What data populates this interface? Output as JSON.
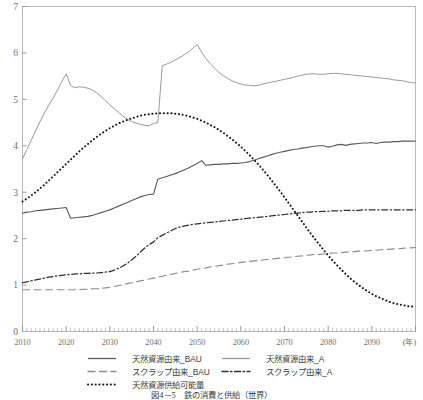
{
  "chart_data": {
    "type": "line",
    "title": "",
    "xlabel": "(年)",
    "ylabel": "",
    "xlim": [
      2010,
      2100
    ],
    "ylim": [
      0,
      7
    ],
    "grid": false,
    "legend_position": "bottom",
    "x_ticks": [
      "2010",
      "2020",
      "2030",
      "2040",
      "2050",
      "2060",
      "2070",
      "2080",
      "2090"
    ],
    "x_tick_values": [
      2010,
      2020,
      2030,
      2040,
      2050,
      2060,
      2070,
      2080,
      2090
    ],
    "x_axis_unit_label": "(年)",
    "y_ticks": [
      "0",
      "1",
      "2",
      "3",
      "4",
      "5",
      "6",
      "7"
    ],
    "y_tick_values": [
      0,
      1,
      2,
      3,
      4,
      5,
      6,
      7
    ],
    "x": [
      2010,
      2011,
      2012,
      2013,
      2014,
      2015,
      2016,
      2017,
      2018,
      2019,
      2020,
      2021,
      2022,
      2023,
      2024,
      2025,
      2026,
      2027,
      2028,
      2029,
      2030,
      2031,
      2032,
      2033,
      2034,
      2035,
      2036,
      2037,
      2038,
      2039,
      2040,
      2041,
      2042,
      2043,
      2044,
      2045,
      2046,
      2047,
      2048,
      2049,
      2050,
      2051,
      2052,
      2053,
      2054,
      2055,
      2056,
      2057,
      2058,
      2059,
      2060,
      2061,
      2062,
      2063,
      2064,
      2065,
      2066,
      2067,
      2068,
      2069,
      2070,
      2071,
      2072,
      2073,
      2074,
      2075,
      2076,
      2077,
      2078,
      2079,
      2080,
      2081,
      2082,
      2083,
      2084,
      2085,
      2086,
      2087,
      2088,
      2089,
      2090,
      2091,
      2092,
      2093,
      2094,
      2095,
      2096,
      2097,
      2098,
      2099,
      2100
    ],
    "series": [
      {
        "name": "天然資源由来_BAU",
        "style": "solid",
        "color": "#5a5a5a",
        "width": 1.15,
        "values": [
          2.55,
          2.57,
          2.58,
          2.6,
          2.61,
          2.62,
          2.63,
          2.64,
          2.65,
          2.66,
          2.67,
          2.44,
          2.45,
          2.46,
          2.47,
          2.48,
          2.5,
          2.53,
          2.56,
          2.59,
          2.62,
          2.66,
          2.7,
          2.74,
          2.78,
          2.82,
          2.86,
          2.9,
          2.93,
          2.95,
          2.96,
          3.28,
          3.31,
          3.34,
          3.37,
          3.4,
          3.44,
          3.48,
          3.52,
          3.57,
          3.62,
          3.68,
          3.58,
          3.59,
          3.6,
          3.6,
          3.61,
          3.61,
          3.62,
          3.62,
          3.63,
          3.64,
          3.66,
          3.69,
          3.72,
          3.75,
          3.78,
          3.81,
          3.84,
          3.86,
          3.88,
          3.9,
          3.92,
          3.93,
          3.95,
          3.96,
          3.98,
          3.99,
          4.0,
          4.0,
          3.97,
          3.99,
          4.02,
          4.03,
          4.01,
          4.03,
          4.04,
          4.05,
          4.06,
          4.06,
          4.07,
          4.05,
          4.07,
          4.08,
          4.08,
          4.09,
          4.09,
          4.1,
          4.1,
          4.1,
          4.1
        ]
      },
      {
        "name": "天然資源由来_A",
        "style": "solid",
        "color": "#999999",
        "width": 1.0,
        "values": [
          3.72,
          3.92,
          4.12,
          4.32,
          4.52,
          4.7,
          4.87,
          5.03,
          5.2,
          5.38,
          5.55,
          5.3,
          5.25,
          5.27,
          5.26,
          5.24,
          5.2,
          5.14,
          5.06,
          4.97,
          4.88,
          4.8,
          4.72,
          4.64,
          4.57,
          4.52,
          4.49,
          4.46,
          4.44,
          4.43,
          4.48,
          4.5,
          5.72,
          5.76,
          5.8,
          5.85,
          5.9,
          5.96,
          6.02,
          6.1,
          6.18,
          6.02,
          5.88,
          5.77,
          5.67,
          5.58,
          5.51,
          5.45,
          5.4,
          5.36,
          5.33,
          5.31,
          5.3,
          5.29,
          5.3,
          5.33,
          5.35,
          5.37,
          5.39,
          5.41,
          5.43,
          5.45,
          5.47,
          5.5,
          5.52,
          5.54,
          5.55,
          5.55,
          5.54,
          5.54,
          5.55,
          5.56,
          5.56,
          5.55,
          5.54,
          5.53,
          5.52,
          5.51,
          5.5,
          5.49,
          5.48,
          5.47,
          5.46,
          5.45,
          5.44,
          5.42,
          5.41,
          5.4,
          5.38,
          5.36,
          5.35
        ]
      },
      {
        "name": "スクラップ由来_BAU",
        "style": "dashed",
        "color": "#8c8c8c",
        "width": 1.15,
        "values": [
          0.9,
          0.9,
          0.9,
          0.9,
          0.9,
          0.9,
          0.9,
          0.9,
          0.9,
          0.9,
          0.9,
          0.9,
          0.9,
          0.9,
          0.91,
          0.91,
          0.92,
          0.92,
          0.93,
          0.94,
          0.95,
          0.97,
          0.99,
          1.01,
          1.03,
          1.05,
          1.07,
          1.09,
          1.11,
          1.13,
          1.15,
          1.17,
          1.19,
          1.21,
          1.23,
          1.25,
          1.27,
          1.29,
          1.3,
          1.32,
          1.34,
          1.36,
          1.37,
          1.39,
          1.4,
          1.42,
          1.43,
          1.45,
          1.46,
          1.47,
          1.49,
          1.5,
          1.51,
          1.52,
          1.53,
          1.54,
          1.55,
          1.56,
          1.57,
          1.58,
          1.59,
          1.6,
          1.61,
          1.62,
          1.63,
          1.64,
          1.65,
          1.66,
          1.66,
          1.67,
          1.68,
          1.69,
          1.69,
          1.7,
          1.71,
          1.71,
          1.72,
          1.73,
          1.73,
          1.74,
          1.75,
          1.75,
          1.76,
          1.77,
          1.77,
          1.78,
          1.78,
          1.79,
          1.8,
          1.8,
          1.81
        ]
      },
      {
        "name": "スクラップ由来_A",
        "style": "dashdot",
        "color": "#2f2f2f",
        "width": 1.25,
        "values": [
          1.05,
          1.07,
          1.09,
          1.11,
          1.13,
          1.15,
          1.17,
          1.18,
          1.2,
          1.21,
          1.22,
          1.23,
          1.24,
          1.24,
          1.25,
          1.25,
          1.26,
          1.26,
          1.27,
          1.28,
          1.29,
          1.32,
          1.36,
          1.41,
          1.47,
          1.54,
          1.62,
          1.71,
          1.8,
          1.87,
          1.93,
          2.02,
          2.07,
          2.12,
          2.17,
          2.22,
          2.25,
          2.27,
          2.29,
          2.31,
          2.32,
          2.33,
          2.34,
          2.35,
          2.36,
          2.37,
          2.38,
          2.39,
          2.4,
          2.41,
          2.42,
          2.43,
          2.44,
          2.45,
          2.46,
          2.47,
          2.48,
          2.49,
          2.5,
          2.51,
          2.52,
          2.53,
          2.54,
          2.55,
          2.56,
          2.57,
          2.57,
          2.58,
          2.58,
          2.59,
          2.59,
          2.6,
          2.6,
          2.6,
          2.61,
          2.61,
          2.61,
          2.61,
          2.62,
          2.62,
          2.62,
          2.62,
          2.62,
          2.62,
          2.62,
          2.62,
          2.62,
          2.62,
          2.62,
          2.62,
          2.62
        ]
      },
      {
        "name": "天然資源供給可能量",
        "style": "dotted",
        "color": "#111111",
        "width": 2.0,
        "values": [
          2.8,
          2.86,
          2.93,
          3.0,
          3.08,
          3.16,
          3.25,
          3.34,
          3.43,
          3.52,
          3.61,
          3.7,
          3.79,
          3.88,
          3.96,
          4.04,
          4.12,
          4.19,
          4.26,
          4.32,
          4.38,
          4.43,
          4.48,
          4.52,
          4.56,
          4.59,
          4.62,
          4.65,
          4.67,
          4.68,
          4.69,
          4.7,
          4.7,
          4.7,
          4.7,
          4.69,
          4.68,
          4.66,
          4.64,
          4.61,
          4.58,
          4.54,
          4.5,
          4.45,
          4.4,
          4.34,
          4.28,
          4.21,
          4.14,
          4.06,
          3.98,
          3.89,
          3.8,
          3.7,
          3.6,
          3.49,
          3.38,
          3.26,
          3.14,
          3.02,
          2.89,
          2.76,
          2.63,
          2.5,
          2.37,
          2.24,
          2.11,
          1.99,
          1.87,
          1.75,
          1.64,
          1.53,
          1.43,
          1.33,
          1.24,
          1.15,
          1.07,
          1.0,
          0.93,
          0.87,
          0.81,
          0.76,
          0.72,
          0.68,
          0.64,
          0.61,
          0.59,
          0.57,
          0.55,
          0.54,
          0.53
        ]
      }
    ]
  },
  "legend": {
    "items": [
      {
        "label": "天然資源由来_BAU",
        "style": "solid",
        "color": "#5a5a5a"
      },
      {
        "label": "天然資源由来_A",
        "style": "solid",
        "color": "#999999"
      },
      {
        "label": "スクラップ由来_BAU",
        "style": "dashed",
        "color": "#8c8c8c"
      },
      {
        "label": "スクラップ由来_A",
        "style": "dashdot",
        "color": "#2f2f2f"
      },
      {
        "label": "天然資源供給可能量",
        "style": "dotted",
        "color": "#111111"
      }
    ]
  },
  "caption": {
    "text": "図4－5　鉄の消費と供給（世界）"
  }
}
